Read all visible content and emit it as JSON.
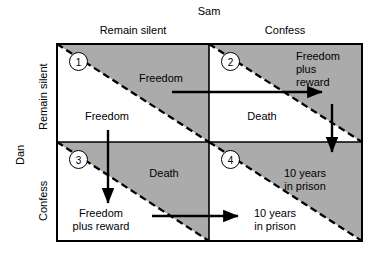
{
  "figure": {
    "title_top": "Sam",
    "title_left": "Dan",
    "column_headers": [
      "Remain silent",
      "Confess"
    ],
    "row_headers": [
      "Remain silent",
      "Confess"
    ],
    "cell_numbers": [
      "1",
      "2",
      "3",
      "4"
    ],
    "cells": [
      {
        "number": "1",
        "row": "Remain silent",
        "column": "Remain silent",
        "sam_payoff": "Freedom",
        "dan_payoff": "Freedom"
      },
      {
        "number": "2",
        "row": "Remain silent",
        "column": "Confess",
        "sam_payoff": "Freedom\nplus\nreward",
        "dan_payoff": "Death"
      },
      {
        "number": "3",
        "row": "Confess",
        "column": "Remain silent",
        "sam_payoff": "Death",
        "dan_payoff": "Freedom\nplus reward"
      },
      {
        "number": "4",
        "row": "Confess",
        "column": "Confess",
        "sam_payoff": "10 years\nin prison",
        "dan_payoff": "10 years\nin prison"
      }
    ],
    "labels": {
      "c1_upper": "Freedom",
      "c1_lower": "Freedom",
      "c2_upper_l1": "Freedom",
      "c2_upper_l2": "plus",
      "c2_upper_l3": "reward",
      "c2_lower": "Death",
      "c3_upper": "Death",
      "c3_lower_l1": "Freedom",
      "c3_lower_l2": "plus reward",
      "c4_upper_l1": "10 years",
      "c4_upper_l2": "in prison",
      "c4_lower_l1": "10 years",
      "c4_lower_l2": "in prison"
    },
    "colors": {
      "shaded_fill": "#ababab",
      "line": "#000000",
      "background": "#ffffff"
    },
    "arrows": [
      {
        "name": "top-horizontal-arrow",
        "direction": "right"
      },
      {
        "name": "bottom-horizontal-arrow",
        "direction": "right"
      },
      {
        "name": "left-vertical-arrow",
        "direction": "down"
      },
      {
        "name": "right-vertical-arrow",
        "direction": "down"
      }
    ]
  }
}
